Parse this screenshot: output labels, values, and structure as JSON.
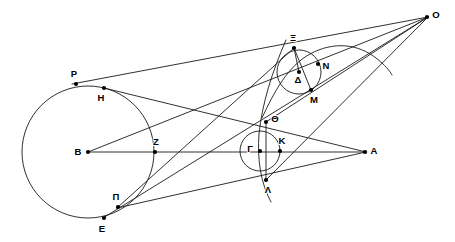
{
  "figure": {
    "width": 455,
    "height": 242,
    "background_color": "#ffffff",
    "stroke_color": "#1a1a1a",
    "label_color": "#000000"
  },
  "points": [
    {
      "id": "O",
      "label": "O",
      "x": 427,
      "y": 17,
      "label_dx": 9,
      "label_dy": -2,
      "dot": true
    },
    {
      "id": "A",
      "label": "A",
      "x": 365,
      "y": 152,
      "label_dx": 9,
      "label_dy": -1,
      "dot": true
    },
    {
      "id": "B",
      "label": "B",
      "x": 88,
      "y": 152,
      "label_dx": -10,
      "label_dy": 0,
      "dot": true
    },
    {
      "id": "P",
      "label": "P",
      "x": 76,
      "y": 84,
      "label_dx": -2,
      "label_dy": -10,
      "dot": true
    },
    {
      "id": "H",
      "label": "H",
      "x": 104,
      "y": 88,
      "label_dx": -3,
      "label_dy": 10,
      "dot": true
    },
    {
      "id": "Z",
      "label": "Z",
      "x": 155,
      "y": 152,
      "label_dx": 1,
      "label_dy": -10,
      "dot": true
    },
    {
      "id": "E",
      "label": "E",
      "x": 104,
      "y": 218,
      "label_dx": -2,
      "label_dy": 11,
      "dot": true
    },
    {
      "id": "P2",
      "label": "Π",
      "x": 118,
      "y": 207,
      "label_dx": -2,
      "label_dy": -10,
      "dot": true
    },
    {
      "id": "G",
      "label": "Γ",
      "x": 260,
      "y": 151,
      "label_dx": -10,
      "label_dy": -2,
      "dot": true
    },
    {
      "id": "K",
      "label": "K",
      "x": 280,
      "y": 151,
      "label_dx": 2,
      "label_dy": -10,
      "dot": true
    },
    {
      "id": "Th",
      "label": "Θ",
      "x": 266,
      "y": 122,
      "label_dx": 9,
      "label_dy": -3,
      "dot": true
    },
    {
      "id": "L",
      "label": "Λ",
      "x": 266,
      "y": 180,
      "label_dx": 2,
      "label_dy": 10,
      "dot": true
    },
    {
      "id": "D",
      "label": "Δ",
      "x": 299,
      "y": 72,
      "label_dx": -1,
      "label_dy": 8,
      "dot": true
    },
    {
      "id": "X",
      "label": "Ξ",
      "x": 294,
      "y": 48,
      "label_dx": -1,
      "label_dy": -10,
      "dot": true
    },
    {
      "id": "N",
      "label": "N",
      "x": 318,
      "y": 64,
      "label_dx": 8,
      "label_dy": 2,
      "dot": true
    },
    {
      "id": "M",
      "label": "M",
      "x": 311,
      "y": 90,
      "label_dx": 3,
      "label_dy": 10,
      "dot": true
    }
  ],
  "circles": [
    {
      "id": "big-circle",
      "name": "circle-center-B",
      "cx": 88,
      "cy": 152,
      "r": 66
    },
    {
      "id": "middle-circle",
      "name": "circle-center-G",
      "cx": 260,
      "cy": 151,
      "r": 20
    },
    {
      "id": "upper-circle",
      "name": "circle-center-D",
      "cx": 299,
      "cy": 72,
      "r": 22
    }
  ],
  "segments": [
    {
      "id": "seg-B-A",
      "name": "line-B-A",
      "x1": 88,
      "y1": 152,
      "x2": 366,
      "y2": 152
    },
    {
      "id": "seg-P-O",
      "name": "line-P-to-O",
      "x1": 72,
      "y1": 84,
      "x2": 428,
      "y2": 17
    },
    {
      "id": "seg-E-O",
      "name": "line-E-to-O",
      "x1": 103,
      "y1": 218,
      "x2": 428,
      "y2": 17
    },
    {
      "id": "seg-B-N-O",
      "name": "line-B-through-N-to-O",
      "x1": 88,
      "y1": 152,
      "x2": 428,
      "y2": 17
    },
    {
      "id": "seg-H-A",
      "name": "line-H-to-A",
      "x1": 104,
      "y1": 88,
      "x2": 366,
      "y2": 152
    },
    {
      "id": "seg-P2-A",
      "name": "line-Pi-to-A",
      "x1": 117,
      "y1": 208,
      "x2": 366,
      "y2": 152
    },
    {
      "id": "seg-P2-X",
      "name": "line-Pi-to-Xi",
      "x1": 117,
      "y1": 208,
      "x2": 294,
      "y2": 48
    },
    {
      "id": "seg-Th-O",
      "name": "line-Theta-to-O",
      "x1": 266,
      "y1": 122,
      "x2": 428,
      "y2": 17
    },
    {
      "id": "seg-L-O",
      "name": "line-Lambda-to-O",
      "x1": 266,
      "y1": 180,
      "x2": 428,
      "y2": 17
    },
    {
      "id": "seg-X-M",
      "name": "chord-Xi-to-M",
      "x1": 294,
      "y1": 48,
      "x2": 311,
      "y2": 90
    },
    {
      "id": "seg-X-D",
      "name": "chord-Xi-to-Delta",
      "x1": 294,
      "y1": 48,
      "x2": 299,
      "y2": 72
    },
    {
      "id": "seg-Th-L",
      "name": "chord-Theta-to-Lambda",
      "x1": 266,
      "y1": 122,
      "x2": 266,
      "y2": 180
    }
  ],
  "arcs": [
    {
      "id": "arc-through-N",
      "name": "arc-upper-right",
      "path": "M 262 118 C 274 92 288 66 310 54 C 334 41 358 44 376 58 C 385 65 390 71 392 75"
    },
    {
      "id": "arc-through-Theta-Lambda",
      "name": "arc-through-Theta-Lambda",
      "path": "M 286 40 C 272 72 262 104 259 134 C 257 160 261 184 271 202"
    }
  ],
  "labels_note": "Greek and Latin letters marking construction points"
}
